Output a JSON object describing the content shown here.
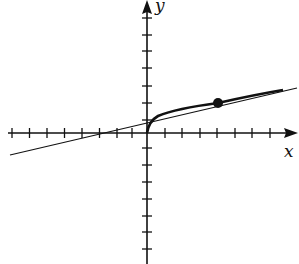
{
  "figure": {
    "x_label": "x",
    "y_label": "y",
    "curve": "y = sqrt(x)",
    "tangent_line": "y = x/4 + 1",
    "point": {
      "x": 4,
      "y": 2
    },
    "x_ticks_negative": 8,
    "x_ticks_positive": 8,
    "y_ticks_positive": 7,
    "y_ticks_negative": 7
  }
}
